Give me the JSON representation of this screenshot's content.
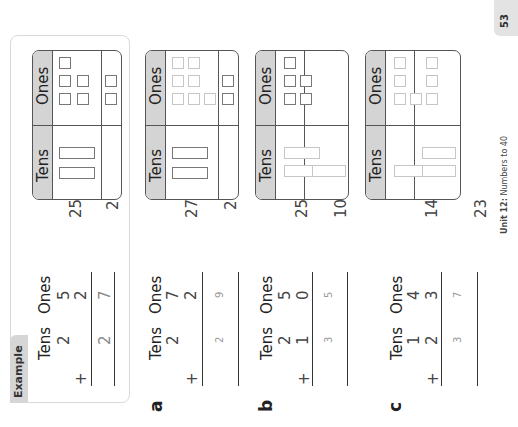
{
  "page": {
    "number": "53",
    "footer_unit": "Unit 12:",
    "footer_title": "Numbers to 40",
    "orientation": "rotated-90-ccw"
  },
  "headers": {
    "tens": "Tens",
    "ones": "Ones"
  },
  "example": {
    "tab_label": "Example",
    "table": {
      "row1_number": "25",
      "row2_number": "2",
      "row1_tens": 2,
      "row1_ones": 5,
      "row2_tens": 0,
      "row2_ones": 2
    },
    "sum": {
      "tens_header": "Tens",
      "ones_header": "Ones",
      "top_tens": "2",
      "top_ones": "5",
      "add_tens": "",
      "add_ones": "2",
      "plus": "+",
      "ans_tens": "2",
      "ans_ones": "7"
    }
  },
  "problems": [
    {
      "label": "a",
      "table": {
        "row1_number": "27",
        "row2_number": "2",
        "row1_tens": 2,
        "row1_ones": 7,
        "row2_tens": 0,
        "row2_ones": 2
      },
      "sum": {
        "tens_header": "Tens",
        "ones_header": "Ones",
        "top_tens": "2",
        "top_ones": "7",
        "add_tens": "",
        "add_ones": "2",
        "plus": "+",
        "ans_tens": "2",
        "ans_ones": "9"
      }
    },
    {
      "label": "b",
      "table": {
        "row1_number": "25",
        "row2_number": "10",
        "row1_tens": 2,
        "row1_ones": 5,
        "row2_tens": 1,
        "row2_ones": 0
      },
      "sum": {
        "tens_header": "Tens",
        "ones_header": "Ones",
        "top_tens": "2",
        "top_ones": "5",
        "add_tens": "1",
        "add_ones": "0",
        "plus": "+",
        "ans_tens": "3",
        "ans_ones": "5"
      }
    },
    {
      "label": "c",
      "table": {
        "row1_number": "14",
        "row2_number": "23",
        "row1_tens": 1,
        "row1_ones": 4,
        "row2_tens": 2,
        "row2_ones": 3
      },
      "sum": {
        "tens_header": "Tens",
        "ones_header": "Ones",
        "top_tens": "1",
        "top_ones": "4",
        "add_tens": "2",
        "add_ones": "3",
        "plus": "+",
        "ans_tens": "3",
        "ans_ones": "7"
      }
    }
  ]
}
